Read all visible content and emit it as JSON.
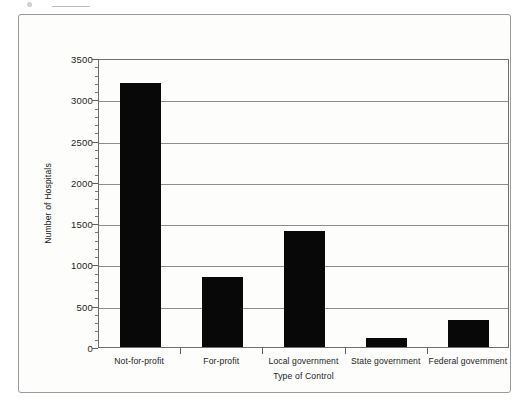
{
  "figure": {
    "background_color": "#fdfdfc",
    "frame_color": "#9a9a9a",
    "bar_color": "#080808",
    "grid_color": "#8d8d8d",
    "axis_color": "#6f6f6f"
  },
  "chart_data": {
    "type": "bar",
    "title": "",
    "xlabel": "Type of Control",
    "ylabel": "Number of Hospitals",
    "categories": [
      "Not-for-profit",
      "For-profit",
      "Local government",
      "State government",
      "Federal government"
    ],
    "values": [
      3200,
      850,
      1400,
      110,
      330
    ],
    "ylim": [
      0,
      3500
    ],
    "ytick_labels": [
      "0",
      "500",
      "1000",
      "1500",
      "2000",
      "2500",
      "3000",
      "3500"
    ],
    "ytick_values": [
      0,
      500,
      1000,
      1500,
      2000,
      2500,
      3000,
      3500
    ],
    "ytick_minor_step": 100,
    "grid": "horizontal",
    "legend": "none",
    "orientation": "vertical",
    "series": [
      {
        "name": "Number of Hospitals",
        "values": [
          3200,
          850,
          1400,
          110,
          330
        ]
      }
    ]
  }
}
